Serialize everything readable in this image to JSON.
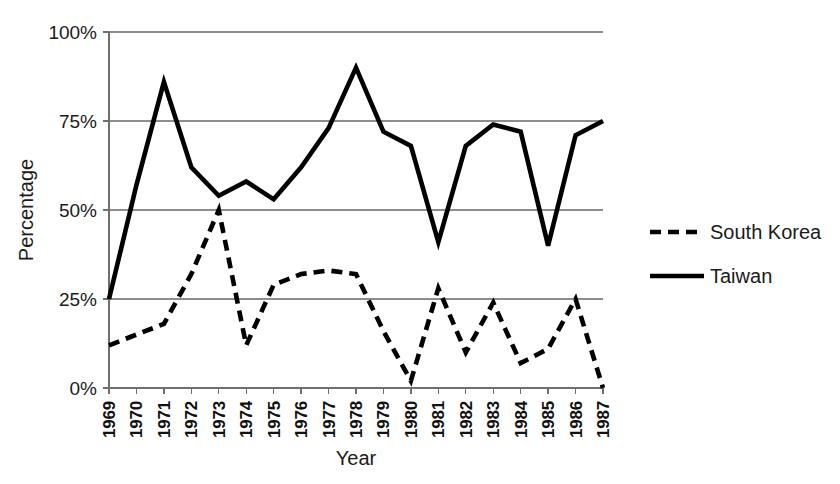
{
  "chart_data": {
    "type": "line",
    "title": "",
    "xlabel": "Year",
    "ylabel": "Percentage",
    "x": [
      1969,
      1970,
      1971,
      1972,
      1973,
      1974,
      1975,
      1976,
      1977,
      1978,
      1979,
      1980,
      1981,
      1982,
      1983,
      1984,
      1985,
      1986,
      1987
    ],
    "categories": [
      "1969",
      "1970",
      "1971",
      "1972",
      "1973",
      "1974",
      "1975",
      "1976",
      "1977",
      "1978",
      "1979",
      "1980",
      "1981",
      "1982",
      "1983",
      "1984",
      "1985",
      "1986",
      "1987"
    ],
    "series": [
      {
        "name": "South Korea",
        "style": "dashed",
        "color": "#000000",
        "values": [
          12,
          15,
          18,
          32,
          50,
          12,
          29,
          32,
          33,
          32,
          16,
          2,
          28,
          10,
          24,
          7,
          11,
          25,
          0
        ]
      },
      {
        "name": "Taiwan",
        "style": "solid",
        "color": "#000000",
        "values": [
          25,
          57,
          86,
          62,
          54,
          58,
          53,
          62,
          73,
          90,
          72,
          68,
          41,
          68,
          74,
          72,
          40,
          71,
          75
        ]
      }
    ],
    "ylim": [
      0,
      100
    ],
    "yticks": [
      0,
      25,
      50,
      75,
      100
    ],
    "ytick_labels": [
      "0%",
      "25%",
      "50%",
      "75%",
      "100%"
    ],
    "grid": true,
    "legend_position": "right"
  },
  "axes": {
    "y_title": "Percentage",
    "x_title": "Year",
    "y_tick_labels": [
      "100%",
      "75%",
      "50%",
      "25%",
      "0%"
    ],
    "x_tick_labels": [
      "1969",
      "1970",
      "1971",
      "1972",
      "1973",
      "1974",
      "1975",
      "1976",
      "1977",
      "1978",
      "1979",
      "1980",
      "1981",
      "1982",
      "1983",
      "1984",
      "1985",
      "1986",
      "1987"
    ]
  },
  "legend": {
    "items": [
      {
        "label": "South Korea",
        "style": "dashed"
      },
      {
        "label": "Taiwan",
        "style": "solid"
      }
    ]
  },
  "colors": {
    "ink": "#000000",
    "grid": "#8d8d8d",
    "axis": "#6f6f6f",
    "background": "#ffffff"
  }
}
